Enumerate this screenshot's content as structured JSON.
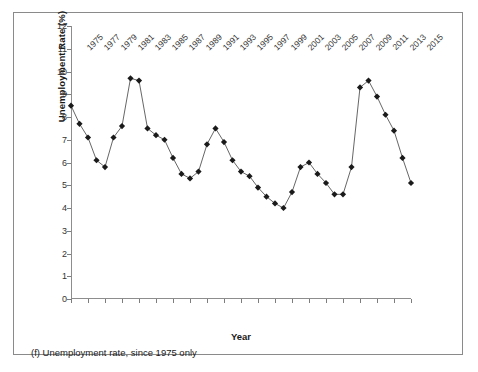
{
  "figure": {
    "caption": "(f) Unemployment rate, since 1975 only",
    "x_axis_title": "Year",
    "y_axis_title": "Unemployment Rate (%)"
  },
  "chart_data": {
    "type": "line",
    "title": "",
    "subtitle": "",
    "xlabel": "Year",
    "ylabel": "Unemployment Rate (%)",
    "xlim": [
      1975,
      2015
    ],
    "ylim": [
      0,
      12
    ],
    "grid": false,
    "legend": "none",
    "marker": "diamond",
    "marker_color": "#1a1a1a",
    "line_color": "#555555",
    "x_tick_labels": [
      "1975",
      "1977",
      "1979",
      "1981",
      "1983",
      "1985",
      "1987",
      "1989",
      "1991",
      "1993",
      "1995",
      "1997",
      "1999",
      "2001",
      "2003",
      "2005",
      "2007",
      "2009",
      "2011",
      "2013",
      "2015"
    ],
    "y_tick_labels": [
      "0",
      "1",
      "2",
      "3",
      "4",
      "5",
      "6",
      "7",
      "8",
      "9",
      "10",
      "11",
      "12"
    ],
    "y_ticks": [
      0,
      1,
      2,
      3,
      4,
      5,
      6,
      7,
      8,
      9,
      10,
      11,
      12
    ],
    "x": [
      1975,
      1976,
      1977,
      1978,
      1979,
      1980,
      1981,
      1982,
      1983,
      1984,
      1985,
      1986,
      1987,
      1988,
      1989,
      1990,
      1991,
      1992,
      1993,
      1994,
      1995,
      1996,
      1997,
      1998,
      1999,
      2000,
      2001,
      2002,
      2003,
      2004,
      2005,
      2006,
      2007,
      2008,
      2009,
      2010,
      2011,
      2012,
      2013,
      2014,
      2015
    ],
    "values": [
      8.5,
      7.7,
      7.1,
      6.1,
      5.8,
      7.1,
      7.6,
      9.7,
      9.6,
      7.5,
      7.2,
      7.0,
      6.2,
      5.5,
      5.3,
      5.6,
      6.8,
      7.5,
      6.9,
      6.1,
      5.6,
      5.4,
      4.9,
      4.5,
      4.2,
      4.0,
      4.7,
      5.8,
      6.0,
      5.5,
      5.1,
      4.6,
      4.6,
      5.8,
      9.3,
      9.6,
      8.9,
      8.1,
      7.4,
      6.2,
      5.1
    ],
    "series": [
      {
        "name": "Unemployment Rate",
        "values": [
          8.5,
          7.7,
          7.1,
          6.1,
          5.8,
          7.1,
          7.6,
          9.7,
          9.6,
          7.5,
          7.2,
          7.0,
          6.2,
          5.5,
          5.3,
          5.6,
          6.8,
          7.5,
          6.9,
          6.1,
          5.6,
          5.4,
          4.9,
          4.5,
          4.2,
          4.0,
          4.7,
          5.8,
          6.0,
          5.5,
          5.1,
          4.6,
          4.6,
          5.8,
          9.3,
          9.6,
          8.9,
          8.1,
          7.4,
          6.2,
          5.1
        ]
      }
    ]
  }
}
